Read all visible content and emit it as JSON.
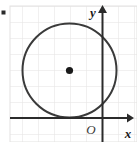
{
  "figure": {
    "type": "coordinate-plane-with-circle",
    "width": 137,
    "height": 142,
    "background_color": "#ffffff",
    "bullet_mark": {
      "name": "list-bullet",
      "x": 3,
      "y": 12,
      "size": 4,
      "color": "#2b2b2b"
    },
    "grid": {
      "visible": true,
      "spacing": 16,
      "color": "#e2e1e0",
      "left": 10,
      "top": 6,
      "right": 137,
      "bottom": 142
    },
    "axes": {
      "color": "#2b2b2b",
      "stroke_width": 2,
      "x_axis": {
        "label": "x",
        "y": 118,
        "x_start": 10,
        "x_end": 131,
        "label_x": 127,
        "label_y": 134,
        "arrow": "right"
      },
      "y_axis": {
        "label": "y",
        "x": 102,
        "y_start": 8,
        "y_end": 142,
        "label_x": 93,
        "label_y": 16,
        "arrow": "up"
      },
      "origin": {
        "label": "O",
        "x": 91,
        "y": 133
      }
    },
    "circle": {
      "center_x": 69.5,
      "center_y": 70.5,
      "radius": 47,
      "stroke_color": "#3a3a3a",
      "stroke_width": 2,
      "fill": "none",
      "tangent_to": "x-axis"
    },
    "center_point": {
      "x": 69.5,
      "y": 70.5,
      "radius": 3.6,
      "color": "#1a1a1a"
    }
  }
}
